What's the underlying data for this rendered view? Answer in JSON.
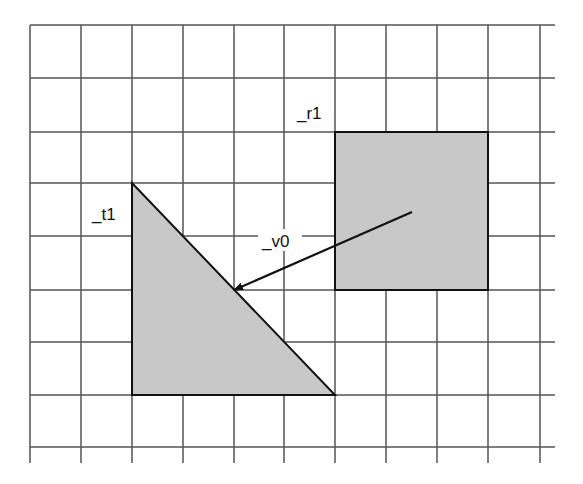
{
  "canvas": {
    "width": 583,
    "height": 484,
    "background": "#ffffff"
  },
  "grid": {
    "line_color": "#555555",
    "x_lines": [
      30,
      81,
      132,
      183,
      234,
      284,
      335,
      386,
      437,
      488,
      540
    ],
    "y_lines": [
      25,
      78,
      132,
      183,
      236,
      290,
      342,
      395,
      447
    ],
    "v_extent": [
      25,
      463
    ],
    "h_extent": [
      30,
      555
    ]
  },
  "shapes": {
    "fill_color": "#c8c8c8",
    "stroke_color": "#111111",
    "triangle": {
      "name": "_t1",
      "points": [
        [
          132,
          183
        ],
        [
          132,
          395
        ],
        [
          335,
          395
        ]
      ],
      "label": {
        "text": "_t1",
        "x": 92,
        "y": 220
      }
    },
    "rectangle": {
      "name": "_r1",
      "x": 335,
      "y": 132,
      "width": 153,
      "height": 158,
      "label": {
        "text": "_r1",
        "x": 297,
        "y": 119
      }
    }
  },
  "vector": {
    "name": "_v0",
    "color": "#111111",
    "from": [
      412,
      212
    ],
    "to": [
      234,
      290
    ],
    "label": {
      "text": "_v0",
      "x": 262,
      "y": 247,
      "bg": {
        "x": 258,
        "y": 229,
        "width": 44,
        "height": 22
      }
    }
  }
}
